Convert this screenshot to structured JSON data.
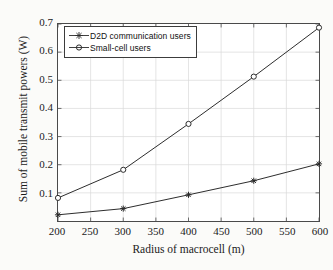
{
  "chart_data": {
    "type": "line",
    "title": "",
    "xlabel": "Radius of macrocell (m)",
    "ylabel": "Sum of mobile transmit powers (W)",
    "x": [
      200,
      300,
      400,
      500,
      600
    ],
    "xlim": [
      200,
      600
    ],
    "ylim": [
      0.0,
      0.7
    ],
    "xticks": [
      200,
      250,
      300,
      350,
      400,
      450,
      500,
      550,
      600
    ],
    "xticklabels": [
      "200",
      "250",
      "300",
      "350",
      "400",
      "450",
      "500",
      "550",
      "600"
    ],
    "yticks": [
      0.1,
      0.2,
      0.3,
      0.4,
      0.5,
      0.6,
      0.7
    ],
    "yticklabels": [
      "0.1",
      "0.2",
      "0.3",
      "0.4",
      "0.5",
      "0.6",
      "0.7"
    ],
    "grid": true,
    "legend_position": "upper left",
    "series": [
      {
        "name": "D2D communication users",
        "marker": "asterisk",
        "color": "#2b2b2b",
        "values": [
          0.022,
          0.044,
          0.093,
          0.143,
          0.203
        ]
      },
      {
        "name": "Small-cell users",
        "marker": "circle",
        "color": "#2b2b2b",
        "values": [
          0.082,
          0.182,
          0.345,
          0.513,
          0.687
        ]
      }
    ]
  },
  "legend": {
    "entries": [
      {
        "label": "D2D communication users"
      },
      {
        "label": "Small-cell users"
      }
    ]
  },
  "colors": {
    "line": "#2b2b2b",
    "grid": "#d9d9d9",
    "axis": "#4a4a4a",
    "text": "#1a1a1a",
    "background": "#fbfbf9",
    "plot_background": "#ffffff"
  }
}
